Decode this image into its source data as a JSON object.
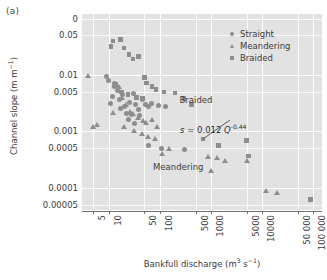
{
  "panel": {
    "tag": "(a)"
  },
  "chart_data": {
    "type": "scatter",
    "title": "",
    "xlabel": "Bankfull discharge (m3 s-1)",
    "ylabel": "Channel slope (m m-1)",
    "xscale": "log",
    "yscale": "log",
    "xlim": [
      3,
      150000
    ],
    "ylim": [
      4e-05,
      0.12
    ],
    "grid": true,
    "legend_position": "top-right",
    "xticks": [
      "5",
      "10",
      "50",
      "100",
      "500",
      "1000",
      "5000",
      "10000",
      "50 000",
      "100 000"
    ],
    "xtick_values": [
      5,
      10,
      50,
      100,
      500,
      1000,
      5000,
      10000,
      50000,
      100000
    ],
    "yticks": [
      "0",
      "0.05",
      "0.01",
      "0.005",
      "0.001",
      "0.0005",
      "0.0001",
      "0.00005"
    ],
    "ytick_values": [
      0.1,
      0.05,
      0.01,
      0.005,
      0.001,
      0.0005,
      0.0001,
      5e-05
    ],
    "marker_color": "#8d8d8d",
    "plot_background": "#e2e2e2",
    "grid_color": "#ffffff",
    "annotations": [
      {
        "text": "Braided",
        "x": 600,
        "y": 0.0035
      },
      {
        "text": "Meandering",
        "x": 260,
        "y": 0.00022
      },
      {
        "text": "s = 0.012 Q",
        "exponent": "-0.44",
        "x": 2600,
        "y": 0.0011
      }
    ],
    "fit_line": {
      "label": "s = 0.012 Q^-0.44",
      "coefficient": 0.012,
      "exponent": -0.44
    },
    "series": [
      {
        "name": "Straight",
        "marker": "circle",
        "points": [
          [
            9,
            0.0095
          ],
          [
            13,
            0.0062
          ],
          [
            12,
            0.0042
          ],
          [
            11,
            0.0031
          ],
          [
            15,
            0.0052
          ],
          [
            16,
            0.0036
          ],
          [
            20,
            0.0028
          ],
          [
            22,
            0.0021
          ],
          [
            19,
            0.0044
          ],
          [
            26,
            0.0033
          ],
          [
            30,
            0.0046
          ],
          [
            34,
            0.003
          ],
          [
            38,
            0.0024
          ],
          [
            45,
            0.0036
          ],
          [
            52,
            0.003
          ],
          [
            60,
            0.0027
          ],
          [
            70,
            0.0031
          ],
          [
            95,
            0.0029
          ],
          [
            130,
            0.0027
          ],
          [
            24,
            0.0016
          ],
          [
            32,
            0.0014
          ],
          [
            60,
            0.00055
          ],
          [
            110,
            0.0005
          ],
          [
            300,
            0.00048
          ],
          [
            17,
            0.0025
          ],
          [
            28,
            0.002
          ],
          [
            40,
            0.0019
          ],
          [
            13,
            0.007
          ],
          [
            10,
            0.0078
          ]
        ]
      },
      {
        "name": "Meandering",
        "marker": "triangle",
        "points": [
          [
            4,
            0.0095
          ],
          [
            5,
            0.0012
          ],
          [
            16,
            0.006
          ],
          [
            18,
            0.0038
          ],
          [
            22,
            0.0029
          ],
          [
            26,
            0.0022
          ],
          [
            30,
            0.002
          ],
          [
            38,
            0.0017
          ],
          [
            46,
            0.0015
          ],
          [
            55,
            0.0014
          ],
          [
            70,
            0.0016
          ],
          [
            90,
            0.0012
          ],
          [
            20,
            0.0012
          ],
          [
            32,
            0.001
          ],
          [
            44,
            0.0009
          ],
          [
            58,
            0.00078
          ],
          [
            80,
            0.00072
          ],
          [
            110,
            0.0004
          ],
          [
            150,
            0.00048
          ],
          [
            900,
            0.00035
          ],
          [
            1300,
            0.00034
          ],
          [
            1900,
            0.0003
          ],
          [
            1000,
            0.0002
          ],
          [
            5000,
            0.0003
          ],
          [
            12000,
            8.5e-05
          ],
          [
            20000,
            8e-05
          ],
          [
            2,
            0.00042
          ],
          [
            6,
            0.0013
          ],
          [
            12,
            0.0021
          ]
        ]
      },
      {
        "name": "Braided",
        "marker": "square",
        "points": [
          [
            12,
            0.04
          ],
          [
            17,
            0.042
          ],
          [
            11,
            0.032
          ],
          [
            20,
            0.03
          ],
          [
            25,
            0.023
          ],
          [
            30,
            0.019
          ],
          [
            38,
            0.021
          ],
          [
            50,
            0.009
          ],
          [
            55,
            0.0072
          ],
          [
            70,
            0.0062
          ],
          [
            85,
            0.0055
          ],
          [
            120,
            0.005
          ],
          [
            200,
            0.0048
          ],
          [
            300,
            0.0038
          ],
          [
            420,
            0.003
          ],
          [
            14,
            0.0068
          ],
          [
            18,
            0.005
          ],
          [
            24,
            0.0045
          ],
          [
            35,
            0.004
          ],
          [
            46,
            0.0038
          ],
          [
            700,
            0.00072
          ],
          [
            1400,
            0.00056
          ],
          [
            5000,
            0.00068
          ],
          [
            5400,
            0.00036
          ],
          [
            90000,
            6.2e-05
          ]
        ]
      }
    ]
  },
  "legend": {
    "items": [
      {
        "label": "Straight",
        "marker": "circle"
      },
      {
        "label": "Meandering",
        "marker": "triangle"
      },
      {
        "label": "Braided",
        "marker": "square"
      }
    ]
  },
  "axes": {
    "y_title_main": "Channel slope (m m",
    "y_title_sup": "−1",
    "y_title_end": ")",
    "x_title_a": "Bankfull discharge (m",
    "x_title_sup1": "3",
    "x_title_b": " s",
    "x_title_sup2": "−1",
    "x_title_end": ")"
  }
}
